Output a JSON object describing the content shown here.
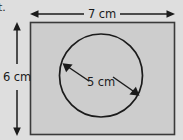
{
  "figure": {
    "type": "geometry-diagram",
    "background_color": "#dedede",
    "shape_fill_color": "#cdcdcd",
    "stroke_color": "#3a3a3a",
    "item_label": "t.",
    "rectangle": {
      "name": "outer-rectangle",
      "width_label": "7 cm",
      "height_label": "6 cm",
      "width_value": 7,
      "height_value": 6,
      "unit": "cm"
    },
    "circle": {
      "name": "inscribed-circle",
      "diameter_label": "5 cm",
      "diameter_value": 5,
      "unit": "cm"
    },
    "dimensions": {
      "top_label": "7 cm",
      "left_label": "6 cm",
      "diameter_label": "5 cm"
    }
  }
}
